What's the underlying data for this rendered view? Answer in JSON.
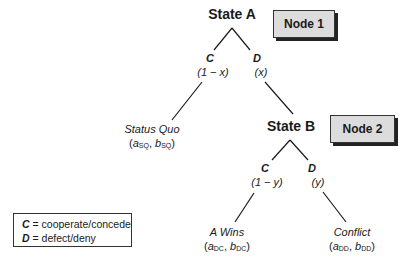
{
  "diagram": {
    "type": "game-tree",
    "nodes": [
      {
        "id": "state_a",
        "label": "State A",
        "node_tag": "Node 1",
        "branches": [
          {
            "move": "C",
            "probability": "(1 − x)"
          },
          {
            "move": "D",
            "probability": "(x)"
          }
        ]
      },
      {
        "id": "state_b",
        "label": "State B",
        "node_tag": "Node 2",
        "branches": [
          {
            "move": "C",
            "probability": "(1 − y)"
          },
          {
            "move": "D",
            "probability": "(y)"
          }
        ]
      }
    ],
    "outcomes": [
      {
        "label": "Status Quo",
        "payoff_a": "a",
        "sub_a": "SQ",
        "payoff_b": "b",
        "sub_b": "SQ"
      },
      {
        "label": "A  Wins",
        "payoff_a": "a",
        "sub_a": "DC",
        "payoff_b": "b",
        "sub_b": "DC"
      },
      {
        "label": "Conflict",
        "payoff_a": "a",
        "sub_a": "DD",
        "payoff_b": "b",
        "sub_b": "DD"
      }
    ],
    "legend": [
      {
        "key": "C",
        "text": " = cooperate/concede"
      },
      {
        "key": "D",
        "text": " = defect/deny"
      }
    ],
    "colors": {
      "line": "#1a1a1a",
      "node_box_fill": "#dcdcdc",
      "node_box_shadow": "#222222"
    }
  }
}
